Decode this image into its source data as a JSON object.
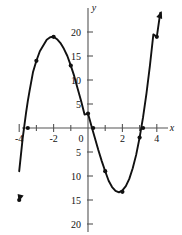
{
  "figure": {
    "background": "#ffffff",
    "curve_color": "#111111",
    "axis_color": "#555555",
    "axis_labels": {
      "x": "x",
      "y": "y"
    },
    "origin_label": "0"
  },
  "chart_data": {
    "type": "line",
    "title": "",
    "xlabel": "x",
    "ylabel": "y",
    "xlim": [
      -4.8,
      5.0
    ],
    "ylim": [
      -22,
      24
    ],
    "grid": false,
    "legend": "none",
    "x_ticks_major": [
      -4,
      -2,
      0,
      2,
      4
    ],
    "x_tick_labels": [
      "-4",
      "-2",
      "0",
      "2",
      "4"
    ],
    "x_ticks_minor": [
      -3,
      -1,
      1,
      3
    ],
    "y_ticks_major": [
      20,
      15,
      10,
      5,
      -5,
      -10,
      -15,
      -20
    ],
    "y_tick_labels": [
      "20",
      "15",
      "10",
      "5",
      "5",
      "10",
      "15",
      "20"
    ],
    "series": [
      {
        "name": "cubic",
        "x": [
          -4.0,
          -3.8,
          -3.6,
          -3.5,
          -3.4,
          -3.2,
          -3.0,
          -2.8,
          -2.6,
          -2.4,
          -2.2,
          -2.0,
          -1.8,
          -1.6,
          -1.4,
          -1.2,
          -1.0,
          -0.8,
          -0.6,
          -0.4,
          -0.2,
          0.0,
          0.2,
          0.4,
          0.6,
          0.8,
          1.0,
          1.2,
          1.4,
          1.6,
          1.8,
          2.0,
          2.2,
          2.4,
          2.6,
          2.8,
          3.0,
          3.2,
          3.4,
          3.6,
          3.8,
          4.0,
          4.2
        ],
        "y": [
          -9.0,
          -2.2,
          3.2,
          5.6,
          7.7,
          11.6,
          14.0,
          16.0,
          17.2,
          18.4,
          18.9,
          19.0,
          18.5,
          17.7,
          16.5,
          15.0,
          13.0,
          10.8,
          8.2,
          5.6,
          2.8,
          3.0,
          0.4,
          -2.1,
          -4.6,
          -6.9,
          -9.0,
          -11.0,
          -12.3,
          -13.1,
          -13.4,
          -13.0,
          -12.1,
          -10.6,
          -8.4,
          -5.6,
          -2.0,
          2.2,
          7.2,
          13.0,
          19.5,
          19.0,
          24.0
        ],
        "equation_shape": "cubic with local max near (-2, 19) and local min near (2, -13)"
      }
    ],
    "marked_points": [
      {
        "x": -4.0,
        "y": -15.0,
        "note": "arrow endpoint lower-left"
      },
      {
        "x": -3.5,
        "y": 0.0,
        "note": "left x-intercept"
      },
      {
        "x": -3.0,
        "y": 14.0
      },
      {
        "x": -2.0,
        "y": 19.0,
        "note": "local maximum"
      },
      {
        "x": -1.0,
        "y": 13.0
      },
      {
        "x": 0.0,
        "y": 3.0,
        "note": "y-intercept"
      },
      {
        "x": 0.3,
        "y": 0.0,
        "note": "x-intercept near origin"
      },
      {
        "x": 1.0,
        "y": -9.0
      },
      {
        "x": 2.0,
        "y": -13.3,
        "note": "local minimum"
      },
      {
        "x": 3.0,
        "y": -2.0
      },
      {
        "x": 3.2,
        "y": 0.0,
        "note": "right x-intercept"
      },
      {
        "x": 4.0,
        "y": 19.0
      }
    ],
    "arrow_endpoints": [
      {
        "x": -4.0,
        "y": -15.0,
        "direction": "down-left"
      },
      {
        "x": 4.25,
        "y": 24.0,
        "direction": "up-right"
      }
    ]
  }
}
